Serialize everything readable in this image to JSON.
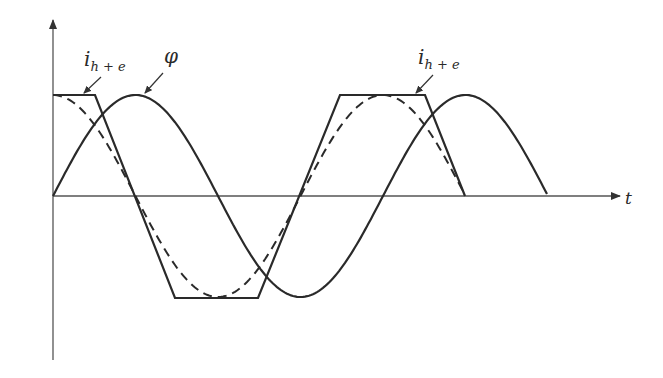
{
  "diagram": {
    "type": "waveform-diagram",
    "axes": {
      "horizontal_label": "t",
      "vertical_label": ""
    },
    "curves": [
      {
        "id": "phi",
        "name": "flux",
        "label": "φ",
        "style": "solid",
        "shape": "sine"
      },
      {
        "id": "i_he",
        "name": "hysteresis-plus-eddy current",
        "label_main": "i",
        "label_sub": "h + e",
        "style": "solid",
        "shape": "trapezoid"
      },
      {
        "id": "fundamental",
        "name": "fundamental component",
        "style": "dashed",
        "shape": "cosine"
      }
    ],
    "labels": {
      "phi": "φ",
      "i_main": "i",
      "i_sub": "h + e",
      "t": "t"
    },
    "colors": {
      "stroke": "#2a2a2a",
      "axis": "#555555",
      "background": "#ffffff"
    }
  }
}
